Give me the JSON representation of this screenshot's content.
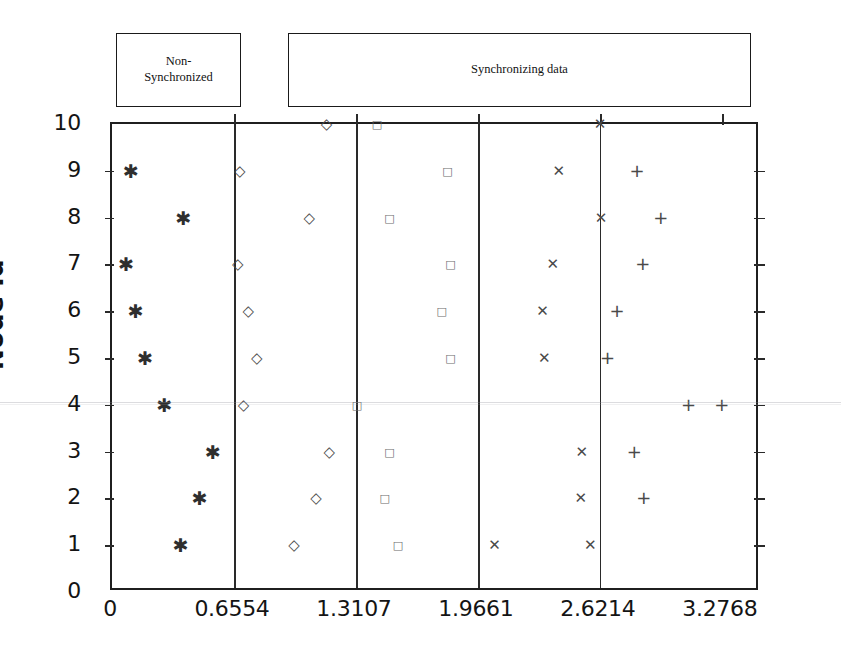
{
  "chart_data": {
    "type": "scatter",
    "title": "",
    "xlabel": "",
    "ylabel": "Node Id",
    "xlim": [
      0,
      3.4816
    ],
    "ylim": [
      0,
      10
    ],
    "grid": false,
    "legend": "none",
    "x_ticks": [
      {
        "value": 0,
        "label": "0"
      },
      {
        "value": 0.6554,
        "label": "0.6554"
      },
      {
        "value": 1.3107,
        "label": "1.3107"
      },
      {
        "value": 1.9661,
        "label": "1.9661"
      },
      {
        "value": 2.6214,
        "label": "2.6214"
      },
      {
        "value": 3.2768,
        "label": "3.2768"
      }
    ],
    "y_ticks": [
      {
        "value": 0,
        "label": "0"
      },
      {
        "value": 1,
        "label": "1"
      },
      {
        "value": 2,
        "label": "2"
      },
      {
        "value": 3,
        "label": "3"
      },
      {
        "value": 4,
        "label": "4"
      },
      {
        "value": 5,
        "label": "5"
      },
      {
        "value": 6,
        "label": "6"
      },
      {
        "value": 7,
        "label": "7"
      },
      {
        "value": 8,
        "label": "8"
      },
      {
        "value": 9,
        "label": "9"
      },
      {
        "value": 10,
        "label": "10"
      }
    ],
    "panel_dividers": [
      0.6554,
      1.3107,
      1.9661,
      2.6214
    ],
    "series": [
      {
        "name": "asterisk",
        "marker": "*",
        "points": [
          {
            "x": 0.102,
            "y": 9
          },
          {
            "x": 0.384,
            "y": 8
          },
          {
            "x": 0.077,
            "y": 7
          },
          {
            "x": 0.128,
            "y": 6
          },
          {
            "x": 0.179,
            "y": 5
          },
          {
            "x": 0.282,
            "y": 4
          },
          {
            "x": 0.543,
            "y": 3
          },
          {
            "x": 0.471,
            "y": 2
          },
          {
            "x": 0.369,
            "y": 1
          }
        ]
      },
      {
        "name": "diamond",
        "marker": "diamond",
        "points": [
          {
            "x": 1.152,
            "y": 10
          },
          {
            "x": 0.686,
            "y": 9
          },
          {
            "x": 1.06,
            "y": 8
          },
          {
            "x": 0.676,
            "y": 7
          },
          {
            "x": 0.732,
            "y": 6
          },
          {
            "x": 0.778,
            "y": 5
          },
          {
            "x": 0.707,
            "y": 4
          },
          {
            "x": 1.167,
            "y": 3
          },
          {
            "x": 1.096,
            "y": 2
          },
          {
            "x": 0.978,
            "y": 1
          }
        ]
      },
      {
        "name": "square",
        "marker": "square",
        "points": [
          {
            "x": 1.424,
            "y": 10
          },
          {
            "x": 1.803,
            "y": 9
          },
          {
            "x": 1.491,
            "y": 8
          },
          {
            "x": 1.818,
            "y": 7
          },
          {
            "x": 1.772,
            "y": 6
          },
          {
            "x": 1.818,
            "y": 5
          },
          {
            "x": 1.316,
            "y": 4
          },
          {
            "x": 1.491,
            "y": 3
          },
          {
            "x": 1.465,
            "y": 2
          },
          {
            "x": 1.537,
            "y": 1
          }
        ]
      },
      {
        "name": "cross",
        "marker": "x",
        "points": [
          {
            "x": 2.622,
            "y": 10
          },
          {
            "x": 2.4,
            "y": 9
          },
          {
            "x": 2.627,
            "y": 8
          },
          {
            "x": 2.369,
            "y": 7
          },
          {
            "x": 2.313,
            "y": 6
          },
          {
            "x": 2.323,
            "y": 5
          },
          {
            "x": 2.524,
            "y": 3
          },
          {
            "x": 2.519,
            "y": 2
          },
          {
            "x": 2.055,
            "y": 1
          },
          {
            "x": 2.57,
            "y": 1
          }
        ]
      },
      {
        "name": "plus",
        "marker": "+",
        "points": [
          {
            "x": 2.821,
            "y": 9
          },
          {
            "x": 2.949,
            "y": 8
          },
          {
            "x": 2.852,
            "y": 7
          },
          {
            "x": 2.714,
            "y": 6
          },
          {
            "x": 2.663,
            "y": 5
          },
          {
            "x": 3.098,
            "y": 4
          },
          {
            "x": 3.277,
            "y": 4
          },
          {
            "x": 2.806,
            "y": 3
          },
          {
            "x": 2.857,
            "y": 2
          }
        ]
      }
    ],
    "annotations": [
      {
        "id": "non-synchronized",
        "lines": [
          "Non-",
          "Synchronized"
        ],
        "x_range": [
          0,
          0.6554
        ]
      },
      {
        "id": "synchronizing-data",
        "lines": [
          "Synchronizing data"
        ],
        "x_range": [
          0.6554,
          3.2768
        ]
      }
    ]
  }
}
